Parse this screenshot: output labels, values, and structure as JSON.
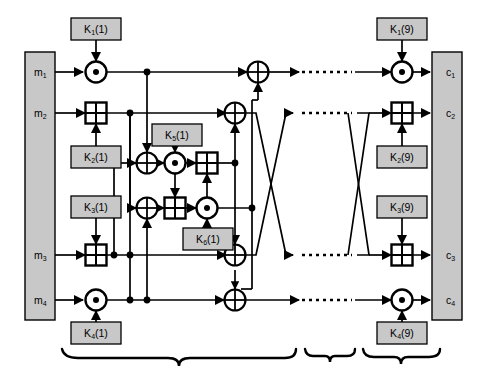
{
  "figure": {
    "type": "block-diagram",
    "background_color": "#ffffff",
    "line_color": "#000000",
    "block_fill": "#c8c8c8",
    "block_stroke": "#000000"
  },
  "input_block": {
    "name": "plaintext-input-block",
    "fill": "#c8c8c8",
    "labels": [
      {
        "id": "m1",
        "base": "m",
        "sub": "1",
        "x": 34,
        "y": 66
      },
      {
        "id": "m2",
        "base": "m",
        "sub": "2",
        "x": 34,
        "y": 107
      },
      {
        "id": "m3",
        "base": "m",
        "sub": "3",
        "x": 34,
        "y": 249
      },
      {
        "id": "m4",
        "base": "m",
        "sub": "4",
        "x": 34,
        "y": 294
      }
    ]
  },
  "output_block": {
    "name": "ciphertext-output-block",
    "fill": "#c8c8c8",
    "labels": [
      {
        "id": "c1",
        "base": "c",
        "sub": "1",
        "x": 446,
        "y": 66
      },
      {
        "id": "c2",
        "base": "c",
        "sub": "2",
        "x": 446,
        "y": 107
      },
      {
        "id": "c3",
        "base": "c",
        "sub": "3",
        "x": 446,
        "y": 249
      },
      {
        "id": "c4",
        "base": "c",
        "sub": "4",
        "x": 446,
        "y": 294
      }
    ]
  },
  "key_boxes": [
    {
      "id": "k1r1",
      "base": "K",
      "sub": "1",
      "round": "(1)",
      "x": 71,
      "y": 18,
      "w": 50,
      "h": 22
    },
    {
      "id": "k2r1",
      "base": "K",
      "sub": "2",
      "round": "(1)",
      "x": 71,
      "y": 146,
      "w": 50,
      "h": 22
    },
    {
      "id": "k3r1",
      "base": "K",
      "sub": "3",
      "round": "(1)",
      "x": 71,
      "y": 196,
      "w": 50,
      "h": 22
    },
    {
      "id": "k4r1",
      "base": "K",
      "sub": "4",
      "round": "(1)",
      "x": 71,
      "y": 322,
      "w": 50,
      "h": 22
    },
    {
      "id": "k5r1",
      "base": "K",
      "sub": "5",
      "round": "(1)",
      "x": 152,
      "y": 124,
      "w": 50,
      "h": 22
    },
    {
      "id": "k6r1",
      "base": "K",
      "sub": "6",
      "round": "(1)",
      "x": 183,
      "y": 228,
      "w": 50,
      "h": 22
    },
    {
      "id": "k1r9",
      "base": "K",
      "sub": "1",
      "round": "(9)",
      "x": 377,
      "y": 18,
      "w": 50,
      "h": 22
    },
    {
      "id": "k2r9",
      "base": "K",
      "sub": "2",
      "round": "(9)",
      "x": 377,
      "y": 146,
      "w": 50,
      "h": 22
    },
    {
      "id": "k3r9",
      "base": "K",
      "sub": "3",
      "round": "(9)",
      "x": 377,
      "y": 196,
      "w": 50,
      "h": 22
    },
    {
      "id": "k4r9",
      "base": "K",
      "sub": "4",
      "round": "(9)",
      "x": 377,
      "y": 322,
      "w": 50,
      "h": 22
    }
  ],
  "operators": [
    {
      "id": "op-mul-r1-row1",
      "kind": "mul",
      "symbol": "circle-dot",
      "x": 96,
      "y": 72
    },
    {
      "id": "op-add-r1-row2",
      "kind": "add",
      "symbol": "box-plus",
      "x": 96,
      "y": 113
    },
    {
      "id": "op-add-r1-row3",
      "kind": "add",
      "symbol": "box-plus",
      "x": 96,
      "y": 255
    },
    {
      "id": "op-mul-r1-row4",
      "kind": "mul",
      "symbol": "circle-dot",
      "x": 96,
      "y": 300
    },
    {
      "id": "op-xor-upper",
      "kind": "xor",
      "symbol": "circle-plus",
      "x": 147,
      "y": 163
    },
    {
      "id": "op-xor-lower",
      "kind": "xor",
      "symbol": "circle-plus",
      "x": 147,
      "y": 208
    },
    {
      "id": "op-ma-mul-top",
      "kind": "mul",
      "symbol": "circle-dot",
      "x": 175,
      "y": 163
    },
    {
      "id": "op-ma-add-top",
      "kind": "add",
      "symbol": "box-plus",
      "x": 207,
      "y": 163
    },
    {
      "id": "op-ma-add-bot",
      "kind": "add",
      "symbol": "box-plus",
      "x": 175,
      "y": 208
    },
    {
      "id": "op-ma-mul-bot",
      "kind": "mul",
      "symbol": "circle-dot",
      "x": 207,
      "y": 208
    },
    {
      "id": "op-xor-out-row1",
      "kind": "xor",
      "symbol": "circle-plus",
      "x": 258,
      "y": 72
    },
    {
      "id": "op-xor-out-row2",
      "kind": "xor",
      "symbol": "circle-plus",
      "x": 235,
      "y": 113
    },
    {
      "id": "op-xor-out-row3",
      "kind": "xor",
      "symbol": "circle-plus",
      "x": 235,
      "y": 255
    },
    {
      "id": "op-xor-out-row4",
      "kind": "xor",
      "symbol": "circle-plus",
      "x": 235,
      "y": 300
    },
    {
      "id": "op-mul-r9-row1",
      "kind": "mul",
      "symbol": "circle-dot",
      "x": 402,
      "y": 72
    },
    {
      "id": "op-add-r9-row2",
      "kind": "add",
      "symbol": "box-plus",
      "x": 402,
      "y": 113
    },
    {
      "id": "op-add-r9-row3",
      "kind": "add",
      "symbol": "box-plus",
      "x": 402,
      "y": 255
    },
    {
      "id": "op-mul-r9-row4",
      "kind": "mul",
      "symbol": "circle-dot",
      "x": 402,
      "y": 300
    }
  ],
  "braces": [
    {
      "id": "brace-rounds-1-8",
      "x1": 62,
      "x2": 296,
      "tip_x": 179
    },
    {
      "id": "brace-gap",
      "x1": 305,
      "x2": 355,
      "tip_x": 330
    },
    {
      "id": "brace-round-9",
      "x1": 363,
      "x2": 440,
      "tip_x": 401
    }
  ],
  "dotted_continuations": [
    {
      "id": "dots-row1",
      "x1": 300,
      "x2": 355,
      "y": 72
    },
    {
      "id": "dots-row2",
      "x1": 300,
      "x2": 355,
      "y": 113
    },
    {
      "id": "dots-row3",
      "x1": 300,
      "x2": 355,
      "y": 255
    },
    {
      "id": "dots-row4",
      "x1": 300,
      "x2": 355,
      "y": 300
    }
  ]
}
